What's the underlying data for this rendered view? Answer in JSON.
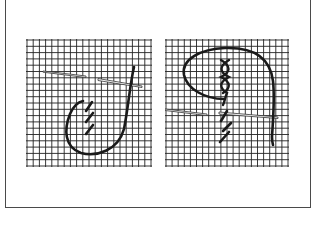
{
  "figure": {
    "panels": [
      {
        "id": "left",
        "description": "Chain stitch step: looped thread with needle passing through fabric grid, three diagonal stitches formed",
        "grid": {
          "x": 26,
          "y": 39,
          "width": 124,
          "height": 127,
          "cols": 20,
          "rows": 20
        }
      },
      {
        "id": "right",
        "description": "Cross/chain stitch step: large thread loop over stitch column with needle passing through fabric grid",
        "grid": {
          "x": 165,
          "y": 39,
          "width": 122,
          "height": 127,
          "cols": 20,
          "rows": 20
        }
      }
    ],
    "caption": "…",
    "colors": {
      "grid": "#222222",
      "thread": "#1a1a1a",
      "needle": "#333333",
      "frame": "#4a4a4a",
      "background": "#ffffff"
    }
  }
}
